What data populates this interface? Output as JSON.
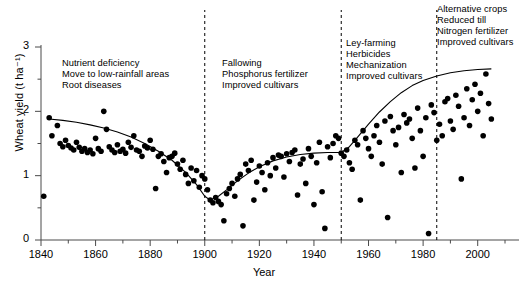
{
  "chart_data": {
    "type": "scatter",
    "title": "",
    "xlabel": "Year",
    "ylabel": "Wheat yield (t ha⁻¹)",
    "xlim": [
      1840,
      2010
    ],
    "ylim": [
      0,
      3
    ],
    "grid": false,
    "legend": null,
    "xticks": [
      1840,
      1860,
      1880,
      1900,
      1920,
      1940,
      1960,
      1980,
      2000
    ],
    "xminor_step": 10,
    "yticks": [
      0,
      1,
      2,
      3
    ],
    "yminor_step": 0.5,
    "marker": {
      "shape": "circle",
      "color": "#000000",
      "size": 3.4
    },
    "trend": {
      "name": "fitted trend curve",
      "color": "#000000",
      "width": 1.1,
      "points": [
        [
          1843,
          1.88
        ],
        [
          1848,
          1.86
        ],
        [
          1853,
          1.83
        ],
        [
          1858,
          1.79
        ],
        [
          1863,
          1.74
        ],
        [
          1868,
          1.68
        ],
        [
          1873,
          1.6
        ],
        [
          1878,
          1.5
        ],
        [
          1883,
          1.38
        ],
        [
          1888,
          1.24
        ],
        [
          1893,
          1.05
        ],
        [
          1897,
          0.86
        ],
        [
          1900,
          0.68
        ],
        [
          1902,
          0.62
        ],
        [
          1905,
          0.68
        ],
        [
          1908,
          0.78
        ],
        [
          1912,
          0.92
        ],
        [
          1916,
          1.04
        ],
        [
          1920,
          1.14
        ],
        [
          1925,
          1.23
        ],
        [
          1930,
          1.29
        ],
        [
          1935,
          1.33
        ],
        [
          1940,
          1.35
        ],
        [
          1945,
          1.36
        ],
        [
          1950,
          1.36
        ],
        [
          1953,
          1.45
        ],
        [
          1956,
          1.6
        ],
        [
          1960,
          1.8
        ],
        [
          1964,
          1.99
        ],
        [
          1968,
          2.15
        ],
        [
          1972,
          2.29
        ],
        [
          1976,
          2.4
        ],
        [
          1980,
          2.48
        ],
        [
          1985,
          2.55
        ],
        [
          1990,
          2.6
        ],
        [
          1995,
          2.63
        ],
        [
          2000,
          2.65
        ],
        [
          2005,
          2.66
        ]
      ]
    },
    "eras": [
      {
        "label": "era-1",
        "start": 1840,
        "end": 1900,
        "annotation": [
          "Nutrient deficiency",
          "Move to low-rainfall areas",
          "Root diseases"
        ]
      },
      {
        "label": "era-2",
        "start": 1900,
        "end": 1950,
        "annotation": [
          "Fallowing",
          "Phosphorus fertilizer",
          "Improved cultivars"
        ]
      },
      {
        "label": "era-3",
        "start": 1950,
        "end": 1985,
        "annotation": [
          "Ley-farming",
          "Herbicides",
          "Mechanization",
          "Improved cultivars"
        ]
      },
      {
        "label": "era-4",
        "start": 1985,
        "end": 2010,
        "annotation": [
          "Alternative crops",
          "Reduced till",
          "Nitrogen fertilizer",
          "Improved cultivars"
        ]
      }
    ],
    "dividers": [
      {
        "year": 1900,
        "style": "dashed"
      },
      {
        "year": 1950,
        "style": "dashed"
      },
      {
        "year": 1985,
        "style": "dashed"
      }
    ],
    "points": [
      [
        1841,
        0.68
      ],
      [
        1843,
        1.9
      ],
      [
        1844,
        1.62
      ],
      [
        1846,
        1.78
      ],
      [
        1847,
        1.5
      ],
      [
        1848,
        1.45
      ],
      [
        1849,
        1.55
      ],
      [
        1850,
        1.47
      ],
      [
        1851,
        1.43
      ],
      [
        1852,
        1.4
      ],
      [
        1853,
        1.52
      ],
      [
        1854,
        1.44
      ],
      [
        1855,
        1.38
      ],
      [
        1856,
        1.42
      ],
      [
        1857,
        1.36
      ],
      [
        1858,
        1.4
      ],
      [
        1859,
        1.34
      ],
      [
        1860,
        1.58
      ],
      [
        1861,
        1.42
      ],
      [
        1862,
        1.38
      ],
      [
        1863,
        2.0
      ],
      [
        1864,
        1.72
      ],
      [
        1865,
        1.45
      ],
      [
        1866,
        1.4
      ],
      [
        1867,
        1.36
      ],
      [
        1868,
        1.48
      ],
      [
        1869,
        1.38
      ],
      [
        1870,
        1.41
      ],
      [
        1871,
        1.35
      ],
      [
        1872,
        1.52
      ],
      [
        1873,
        1.44
      ],
      [
        1874,
        1.62
      ],
      [
        1875,
        1.4
      ],
      [
        1876,
        1.38
      ],
      [
        1877,
        1.3
      ],
      [
        1878,
        1.46
      ],
      [
        1879,
        1.43
      ],
      [
        1880,
        1.55
      ],
      [
        1881,
        1.41
      ],
      [
        1882,
        0.8
      ],
      [
        1883,
        1.3
      ],
      [
        1884,
        1.34
      ],
      [
        1885,
        1.22
      ],
      [
        1886,
        1.05
      ],
      [
        1887,
        1.28
      ],
      [
        1888,
        1.3
      ],
      [
        1889,
        1.35
      ],
      [
        1890,
        1.18
      ],
      [
        1891,
        1.1
      ],
      [
        1892,
        1.24
      ],
      [
        1893,
        1.02
      ],
      [
        1894,
        0.88
      ],
      [
        1895,
        1.12
      ],
      [
        1896,
        0.92
      ],
      [
        1897,
        1.08
      ],
      [
        1898,
        0.82
      ],
      [
        1899,
        1.0
      ],
      [
        1900,
        0.95
      ],
      [
        1901,
        0.78
      ],
      [
        1902,
        0.62
      ],
      [
        1903,
        0.58
      ],
      [
        1904,
        0.66
      ],
      [
        1905,
        0.6
      ],
      [
        1906,
        0.55
      ],
      [
        1907,
        0.3
      ],
      [
        1908,
        0.72
      ],
      [
        1909,
        0.8
      ],
      [
        1910,
        0.88
      ],
      [
        1911,
        0.68
      ],
      [
        1912,
        0.95
      ],
      [
        1913,
        1.02
      ],
      [
        1914,
        0.22
      ],
      [
        1915,
        1.18
      ],
      [
        1916,
        1.08
      ],
      [
        1917,
        1.24
      ],
      [
        1918,
        0.62
      ],
      [
        1919,
        0.9
      ],
      [
        1920,
        1.15
      ],
      [
        1921,
        1.05
      ],
      [
        1922,
        0.78
      ],
      [
        1923,
        1.2
      ],
      [
        1924,
        1.0
      ],
      [
        1925,
        1.28
      ],
      [
        1926,
        1.12
      ],
      [
        1927,
        1.32
      ],
      [
        1928,
        1.3
      ],
      [
        1929,
        0.98
      ],
      [
        1930,
        1.34
      ],
      [
        1931,
        1.22
      ],
      [
        1932,
        1.36
      ],
      [
        1933,
        1.4
      ],
      [
        1934,
        0.7
      ],
      [
        1935,
        1.18
      ],
      [
        1936,
        1.26
      ],
      [
        1937,
        0.88
      ],
      [
        1938,
        1.42
      ],
      [
        1939,
        1.3
      ],
      [
        1940,
        0.55
      ],
      [
        1941,
        1.2
      ],
      [
        1942,
        1.52
      ],
      [
        1943,
        0.75
      ],
      [
        1944,
        0.18
      ],
      [
        1945,
        1.45
      ],
      [
        1946,
        1.28
      ],
      [
        1947,
        1.5
      ],
      [
        1948,
        1.62
      ],
      [
        1949,
        1.58
      ],
      [
        1950,
        1.35
      ],
      [
        1951,
        1.3
      ],
      [
        1952,
        1.4
      ],
      [
        1953,
        1.2
      ],
      [
        1954,
        1.1
      ],
      [
        1955,
        1.55
      ],
      [
        1956,
        1.48
      ],
      [
        1957,
        0.62
      ],
      [
        1958,
        1.7
      ],
      [
        1959,
        1.58
      ],
      [
        1960,
        1.42
      ],
      [
        1961,
        1.3
      ],
      [
        1962,
        1.62
      ],
      [
        1963,
        1.78
      ],
      [
        1964,
        1.52
      ],
      [
        1965,
        1.18
      ],
      [
        1966,
        1.85
      ],
      [
        1967,
        0.35
      ],
      [
        1968,
        1.92
      ],
      [
        1969,
        1.7
      ],
      [
        1970,
        1.48
      ],
      [
        1971,
        1.75
      ],
      [
        1972,
        1.05
      ],
      [
        1973,
        1.95
      ],
      [
        1974,
        1.82
      ],
      [
        1975,
        1.88
      ],
      [
        1976,
        1.58
      ],
      [
        1977,
        1.12
      ],
      [
        1978,
        2.05
      ],
      [
        1979,
        1.7
      ],
      [
        1980,
        1.3
      ],
      [
        1981,
        1.9
      ],
      [
        1982,
        0.1
      ],
      [
        1983,
        2.1
      ],
      [
        1984,
        1.98
      ],
      [
        1985,
        1.55
      ],
      [
        1986,
        1.8
      ],
      [
        1987,
        1.62
      ],
      [
        1988,
        2.15
      ],
      [
        1989,
        2.2
      ],
      [
        1990,
        1.85
      ],
      [
        1991,
        1.72
      ],
      [
        1992,
        2.25
      ],
      [
        1993,
        2.08
      ],
      [
        1994,
        0.95
      ],
      [
        1995,
        1.9
      ],
      [
        1996,
        2.35
      ],
      [
        1997,
        1.78
      ],
      [
        1998,
        2.18
      ],
      [
        1999,
        2.42
      ],
      [
        2000,
        2.0
      ],
      [
        2001,
        2.28
      ],
      [
        2002,
        1.62
      ],
      [
        2003,
        2.58
      ],
      [
        2004,
        2.12
      ],
      [
        2005,
        1.88
      ]
    ]
  }
}
